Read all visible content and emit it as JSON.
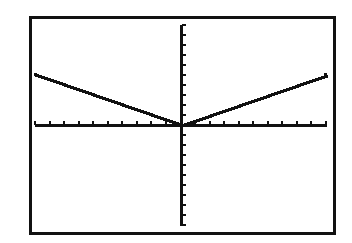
{
  "screen": {
    "title": "Graphing calculator graph screen"
  },
  "chart_data": {
    "type": "line",
    "title": "",
    "function": "y = 0.5|x|",
    "xlabel": "",
    "ylabel": "",
    "xlim": [
      -10,
      10
    ],
    "ylim": [
      -10,
      10
    ],
    "xscl": 1,
    "yscl": 1,
    "grid": false,
    "axes": true,
    "tick_marks": true,
    "legend": null,
    "series": [
      {
        "name": "Y1",
        "x": [
          -10,
          -8,
          -6,
          -4,
          -2,
          0,
          2,
          4,
          6,
          8,
          10
        ],
        "values": [
          5,
          4,
          3,
          2,
          1,
          0,
          1,
          2,
          3,
          4,
          5
        ]
      }
    ],
    "colors": {
      "frame": "#111111",
      "axes": "#111111",
      "curve": "#111111",
      "background": "#ffffff"
    }
  }
}
